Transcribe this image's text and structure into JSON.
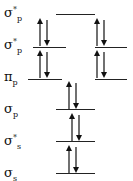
{
  "diagram": {
    "levels": [
      {
        "label_main": "σ",
        "label_sup": "*",
        "label_sub": "p",
        "electrons": 0,
        "orbitals": 1
      },
      {
        "label_main": "σ",
        "label_sup": "*",
        "label_sub": "p",
        "electrons": 4,
        "orbitals": 2
      },
      {
        "label_main": "π",
        "label_sup": "",
        "label_sub": "p",
        "electrons": 4,
        "orbitals": 2
      },
      {
        "label_main": "σ",
        "label_sup": "",
        "label_sub": "p",
        "electrons": 2,
        "orbitals": 1
      },
      {
        "label_main": "σ",
        "label_sup": "*",
        "label_sub": "s",
        "electrons": 2,
        "orbitals": 1
      },
      {
        "label_main": "σ",
        "label_sup": "",
        "label_sub": "s",
        "electrons": 2,
        "orbitals": 1
      }
    ],
    "colors": {
      "line": "#222222",
      "arrow": "#111111"
    }
  }
}
